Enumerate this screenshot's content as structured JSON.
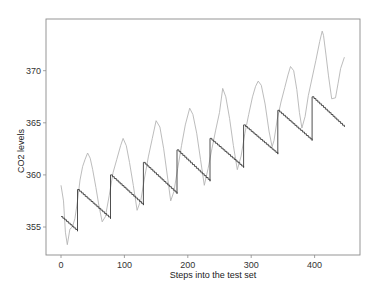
{
  "chart_data": {
    "type": "line",
    "title": "",
    "xlabel": "Steps into the test set",
    "ylabel": "CO2 levels",
    "xlim": [
      -25,
      470
    ],
    "ylim": [
      352.2,
      375.0
    ],
    "xticks": [
      0,
      100,
      200,
      300,
      400
    ],
    "yticks": [
      355,
      360,
      365,
      370
    ],
    "grid": false,
    "legend": null,
    "series": [
      {
        "name": "actual",
        "color": "#b4b4b4",
        "style": "solid",
        "x": [
          0,
          4,
          7,
          10,
          14,
          18,
          22,
          26,
          30,
          34,
          38,
          42,
          46,
          50,
          55,
          60,
          65,
          70,
          76,
          82,
          88,
          94,
          98,
          103,
          108,
          114,
          120,
          126,
          132,
          138,
          144,
          150,
          156,
          162,
          168,
          173,
          178,
          184,
          190,
          196,
          203,
          208,
          214,
          220,
          226,
          232,
          238,
          244,
          250,
          255,
          260,
          266,
          272,
          278,
          284,
          290,
          296,
          302,
          307,
          311,
          316,
          322,
          328,
          333,
          336,
          341,
          347,
          353,
          358,
          362,
          367,
          372,
          376,
          380,
          385,
          390,
          396,
          402,
          408,
          412,
          414,
          418,
          422,
          427,
          433,
          437,
          441,
          447
        ],
        "y": [
          359.0,
          357.5,
          354.5,
          353.3,
          354.8,
          355.0,
          355.8,
          357.5,
          359.5,
          360.8,
          361.5,
          362.1,
          361.6,
          360.5,
          358.8,
          357.0,
          355.5,
          356.0,
          358.0,
          360.2,
          361.5,
          362.8,
          363.5,
          362.8,
          361.2,
          359.0,
          356.6,
          357.6,
          359.8,
          361.8,
          363.5,
          365.2,
          364.6,
          362.5,
          359.8,
          357.5,
          358.4,
          360.6,
          362.8,
          364.8,
          366.4,
          365.8,
          364.0,
          361.5,
          359.0,
          360.6,
          362.5,
          364.3,
          366.0,
          368.3,
          367.5,
          365.4,
          362.8,
          360.5,
          361.8,
          364.0,
          365.8,
          367.5,
          368.5,
          369.0,
          368.6,
          366.8,
          364.2,
          362.7,
          363.3,
          365.3,
          367.0,
          368.4,
          369.6,
          370.4,
          370.0,
          368.2,
          366.0,
          364.5,
          365.6,
          367.6,
          369.3,
          371.0,
          372.8,
          373.8,
          373.4,
          371.5,
          369.5,
          367.3,
          367.4,
          368.8,
          370.2,
          371.3
        ]
      },
      {
        "name": "forecast",
        "color": "#3c3c3c",
        "style": "step-sawtooth",
        "segments": [
          {
            "x0": 0,
            "y0": 356.0,
            "x1": 26,
            "y1": 354.6
          },
          {
            "x0": 26,
            "y0": 358.6,
            "x1": 78,
            "y1": 355.8
          },
          {
            "x0": 78,
            "y0": 360.0,
            "x1": 130,
            "y1": 357.1
          },
          {
            "x0": 130,
            "y0": 361.2,
            "x1": 183,
            "y1": 358.2
          },
          {
            "x0": 183,
            "y0": 362.4,
            "x1": 235,
            "y1": 359.4
          },
          {
            "x0": 235,
            "y0": 363.5,
            "x1": 288,
            "y1": 360.7
          },
          {
            "x0": 288,
            "y0": 364.8,
            "x1": 342,
            "y1": 362.0
          },
          {
            "x0": 342,
            "y0": 366.2,
            "x1": 396,
            "y1": 363.3
          },
          {
            "x0": 396,
            "y0": 367.5,
            "x1": 447,
            "y1": 364.6
          }
        ]
      }
    ]
  },
  "plot_area": {
    "left": 46,
    "top": 19,
    "right": 360,
    "bottom": 255
  }
}
